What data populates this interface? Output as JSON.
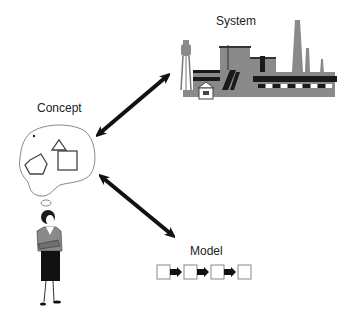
{
  "diagram": {
    "nodes": [
      {
        "id": "system",
        "label": "System",
        "icon": "factory-icon"
      },
      {
        "id": "concept",
        "label": "Concept",
        "icon": "thought-bubble-icon",
        "shapes": [
          "triangle",
          "pentagon",
          "square"
        ]
      },
      {
        "id": "model",
        "label": "Model",
        "icon": "block-chain-icon",
        "blocks": 4
      }
    ],
    "edges": [
      {
        "from": "concept",
        "to": "system",
        "type": "bidirectional-arrow"
      },
      {
        "from": "concept",
        "to": "model",
        "type": "bidirectional-arrow"
      }
    ],
    "person": {
      "icon": "woman-thinking-icon"
    }
  },
  "colors": {
    "arrow": "#111111",
    "factory_gray": "#8a8a8a",
    "factory_dark": "#1a1a1a",
    "outline": "#555555"
  }
}
